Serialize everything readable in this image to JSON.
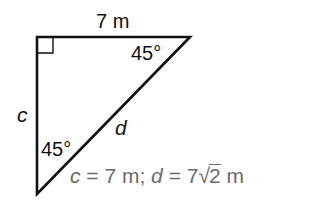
{
  "figure": {
    "type": "right isosceles triangle (45-45-90)",
    "vertices": {
      "right_angle": [
        37,
        37
      ],
      "top_right": [
        190,
        37
      ],
      "bottom": [
        37,
        194
      ]
    },
    "stroke_color": "#111111",
    "right_angle_marker": true
  },
  "labels": {
    "top_side": "7 m",
    "left_side": "c",
    "hypotenuse": "d",
    "angle_top_right": "45°",
    "angle_bottom": "45°"
  },
  "answer": {
    "c_var": "c",
    "c_eq": " = 7 m; ",
    "d_var": "d",
    "d_eq": " = 7",
    "radical_symbol": "√",
    "radicand": "2",
    "unit": " m",
    "color": "#6a6a6a"
  }
}
